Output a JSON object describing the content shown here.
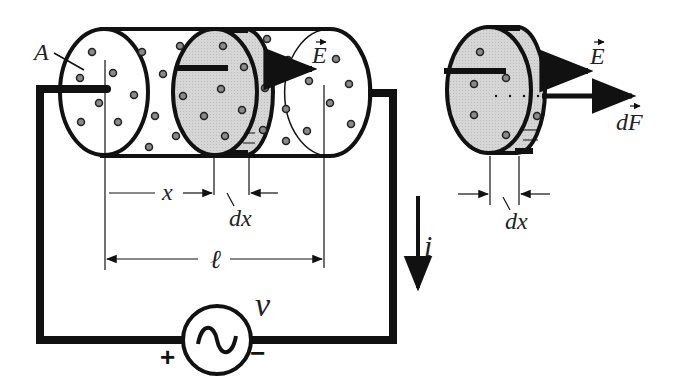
{
  "diagram": {
    "labels": {
      "area": "A",
      "field_main": "E",
      "field_slice": "E",
      "force": "dF",
      "position": "x",
      "thickness_main": "dx",
      "thickness_slice": "dx",
      "length": "ℓ",
      "current": "i",
      "voltage": "v",
      "plus": "+",
      "minus": "−",
      "source_symbol": "~"
    },
    "colors": {
      "line": "#111111",
      "slab_fill": "#d4d4d4",
      "particle_fill": "#8a8a8a",
      "background": "#ffffff"
    }
  }
}
